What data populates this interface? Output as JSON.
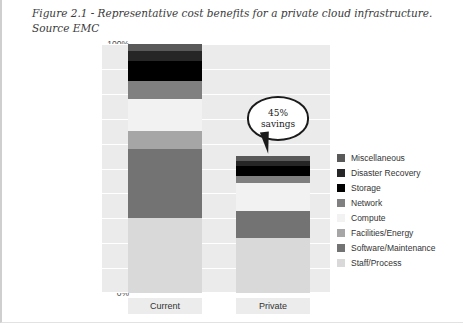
{
  "caption": {
    "line1": "Figure 2.1 - Representative cost benefits for a private cloud infrastructure.",
    "line2": "Source EMC"
  },
  "callout": {
    "value": "45%",
    "label": "savings",
    "name": "savings-callout"
  },
  "chart_data": {
    "type": "bar",
    "subtype": "stacked-100-percent",
    "title": "Figure 2.1 - Representative cost benefits for a private cloud infrastructure. Source EMC",
    "xlabel": "",
    "ylabel": "",
    "ylim": [
      0,
      100
    ],
    "yticks": [
      "0%",
      "10%",
      "20%",
      "30%",
      "40%",
      "50%",
      "60%",
      "70%",
      "80%",
      "90%",
      "100%"
    ],
    "grid": true,
    "legend_position": "right",
    "categories": [
      "Current",
      "Private"
    ],
    "series": [
      {
        "name": "Staff/Process",
        "color": "#d9d9d9",
        "values": [
          30,
          22
        ]
      },
      {
        "name": "Software/Maintenance",
        "color": "#737373",
        "values": [
          28,
          11
        ]
      },
      {
        "name": "Facilities/Energy",
        "color": "#a6a6a6",
        "values": [
          7,
          0
        ]
      },
      {
        "name": "Compute",
        "color": "#f2f2f2",
        "values": [
          13,
          11
        ]
      },
      {
        "name": "Network",
        "color": "#808080",
        "values": [
          7,
          3
        ]
      },
      {
        "name": "Storage",
        "color": "#000000",
        "values": [
          8,
          4
        ]
      },
      {
        "name": "Disaster Recovery",
        "color": "#262626",
        "values": [
          4,
          2
        ]
      },
      {
        "name": "Miscellaneous",
        "color": "#595959",
        "values": [
          3,
          2
        ]
      }
    ],
    "annotations": [
      {
        "text": "45% savings",
        "target": "Private",
        "type": "callout-bubble"
      }
    ]
  },
  "legend": {
    "items": [
      {
        "label": "Miscellaneous",
        "color": "#595959"
      },
      {
        "label": "Disaster Recovery",
        "color": "#262626"
      },
      {
        "label": "Storage",
        "color": "#000000"
      },
      {
        "label": "Network",
        "color": "#808080"
      },
      {
        "label": "Compute",
        "color": "#f2f2f2"
      },
      {
        "label": "Facilities/Energy",
        "color": "#a6a6a6"
      },
      {
        "label": "Software/Maintenance",
        "color": "#737373"
      },
      {
        "label": "Staff/Process",
        "color": "#d9d9d9"
      }
    ]
  }
}
